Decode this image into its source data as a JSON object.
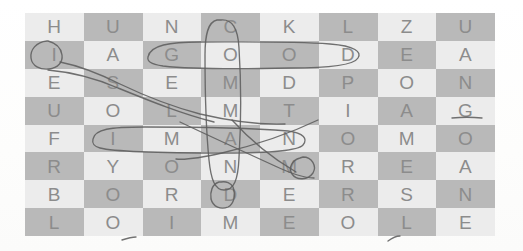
{
  "puzzle": {
    "title": "word-search-grid",
    "columns": 8,
    "rows": 8,
    "cell_colors": {
      "light": "#ececec",
      "dark": "#b9b9b9"
    },
    "letter_color": "#8c8c8c",
    "ink_color": "#5d5d5d",
    "rows_letters": [
      [
        "H",
        "U",
        "N",
        "C",
        "K",
        "L",
        "Z",
        "U"
      ],
      [
        "I",
        "A",
        "G",
        "O",
        "O",
        "D",
        "E",
        "A"
      ],
      [
        "E",
        "S",
        "E",
        "M",
        "D",
        "P",
        "O",
        "N"
      ],
      [
        "U",
        "O",
        "L",
        "M",
        "T",
        "I",
        "A",
        "G"
      ],
      [
        "F",
        "I",
        "M",
        "A",
        "N",
        "O",
        "M",
        "O"
      ],
      [
        "R",
        "Y",
        "O",
        "N",
        "M",
        "R",
        "E",
        "A"
      ],
      [
        "B",
        "O",
        "R",
        "D",
        "E",
        "R",
        "S",
        "N"
      ],
      [
        "L",
        "O",
        "I",
        "M",
        "E",
        "O",
        "L",
        "E"
      ]
    ]
  },
  "annotations": {
    "marks": [
      {
        "name": "circle-word-good",
        "type": "horizontal-loop",
        "word": "GOOD",
        "row": 1,
        "cols": "2-5"
      },
      {
        "name": "circle-word-commande",
        "type": "vertical-loop",
        "word": "COMMANDE",
        "col": 3,
        "rows": "0-6"
      },
      {
        "name": "circle-word-iman",
        "type": "horizontal-loop",
        "word": "IMAN",
        "row": 4,
        "cols": "1-4"
      },
      {
        "name": "circle-letter-i",
        "type": "small-loop",
        "word": "I",
        "row": 1,
        "col": 0
      },
      {
        "name": "diagonal-stroke-a",
        "type": "diagonal-line",
        "word": "",
        "row": 4,
        "col": 3
      },
      {
        "name": "diagonal-stroke-b",
        "type": "diagonal-line",
        "word": "",
        "row": 5,
        "col": 4
      },
      {
        "name": "sweep-stroke",
        "type": "curve",
        "word": "",
        "row": 2,
        "col": 1
      }
    ]
  }
}
